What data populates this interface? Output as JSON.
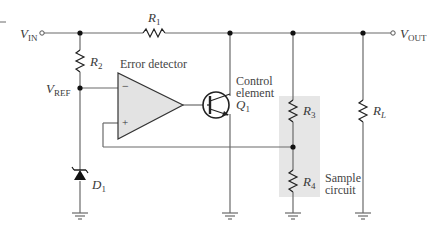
{
  "diagram": {
    "terminals": {
      "vin": {
        "main": "V",
        "sub": "IN"
      },
      "vout": {
        "main": "V",
        "sub": "OUT"
      },
      "vref": {
        "main": "V",
        "sub": "REF"
      }
    },
    "components": {
      "r1": {
        "main": "R",
        "sub": "1"
      },
      "r2": {
        "main": "R",
        "sub": "2"
      },
      "r3": {
        "main": "R",
        "sub": "3"
      },
      "r4": {
        "main": "R",
        "sub": "4"
      },
      "rl": {
        "main": "R",
        "sub": "L"
      },
      "d1": {
        "main": "D",
        "sub": "1"
      },
      "q1": {
        "main": "Q",
        "sub": "1"
      }
    },
    "blocks": {
      "error_detector": "Error detector",
      "control_element_line1": "Control",
      "control_element_line2": "element",
      "sample_circuit_line1": "Sample",
      "sample_circuit_line2": "circuit"
    },
    "opamp_inputs": {
      "inverting": "−",
      "noninverting": "+"
    },
    "colors": {
      "wire": "#6a6a6a",
      "opamp_fill": "#e3e3e3",
      "sample_box_fill": "#e6e6e6",
      "node": "#111111"
    }
  }
}
